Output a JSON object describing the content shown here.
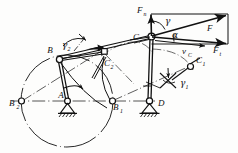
{
  "figure": {
    "colors": {
      "ink": "#111111",
      "paper": "#fdfdfc",
      "centerline": "#2a2a2a"
    },
    "labels": {
      "B": "B",
      "B1": "B",
      "B1_sub": "1",
      "B2": "B",
      "B2_sub": "2",
      "A": "A",
      "C": "C",
      "C1": "C",
      "C1_sub": "1",
      "C2": "C",
      "C2_sub": "2",
      "D": "D",
      "F": "F",
      "Fn": "F",
      "Fn_sub": "n",
      "Ft": "F",
      "Ft_sub": "t",
      "vC": "v",
      "vC_sub": "C",
      "alpha": "α",
      "gamma": "γ",
      "gamma1": "γ",
      "gamma1_sub": "1",
      "gamma2": "γ",
      "gamma2_sub": "2"
    },
    "elements": {
      "crank_circle": "crank-path-circle",
      "ground_A": "ground-support-A",
      "ground_D": "ground-support-D",
      "link_AB": "crank-link-AB",
      "link_BC": "coupler-link-BC",
      "link_CD": "rocker-link-CD",
      "force_parallelogram": "force-parallelogram-at-C",
      "rotation_arrow": "crank-rotation-arrow"
    }
  }
}
